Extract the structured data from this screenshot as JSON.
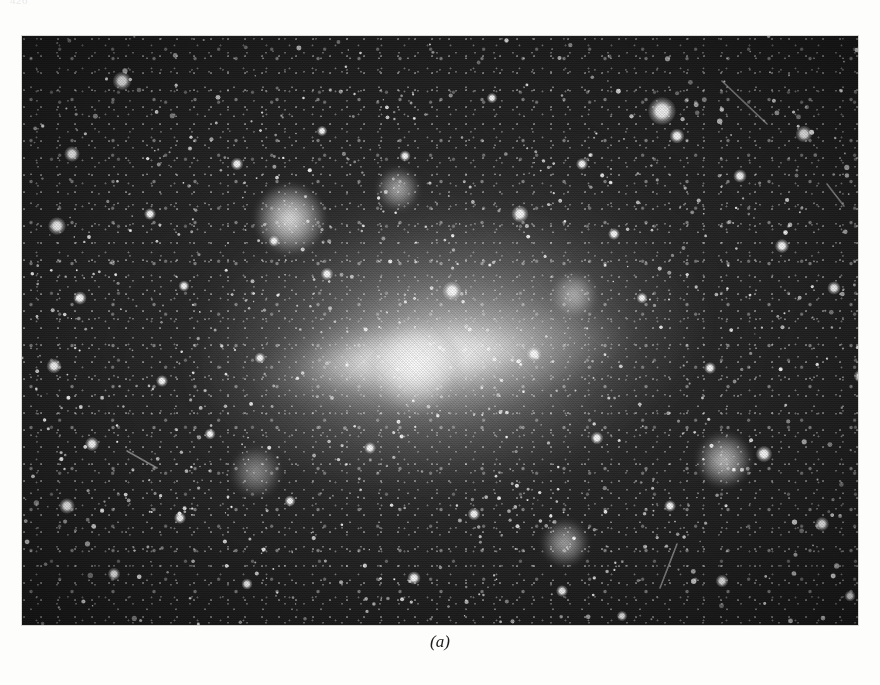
{
  "page": {
    "background_color": "#fdfdfc",
    "running_head": "426"
  },
  "figure": {
    "caption": "(a)",
    "plate_type": "halftone black-and-white astrophotograph",
    "frame": {
      "x": 22,
      "y": 36,
      "width": 836,
      "height": 589
    },
    "colors": {
      "sky_dark": "#1d1d1d",
      "sky_deep": "#141414",
      "star_white": "#ffffff",
      "halo_grey": "#a0a0a0",
      "plate_border": "#d8d8d6",
      "caption_ink": "#1c1c1c"
    },
    "knots": [
      {
        "name": "northwest-nebular-knot",
        "x": 32,
        "y": 31,
        "r": 34,
        "intensity": 0.95
      },
      {
        "name": "north-central-knot",
        "x": 45,
        "y": 26,
        "r": 20,
        "intensity": 0.7
      },
      {
        "name": "central-bar-core",
        "x": 47,
        "y": 56,
        "r": 46,
        "intensity": 1.0
      },
      {
        "name": "east-arm-knot",
        "x": 66,
        "y": 44,
        "r": 22,
        "intensity": 0.62
      },
      {
        "name": "southeast-cluster",
        "x": 84,
        "y": 72,
        "r": 26,
        "intensity": 0.78
      },
      {
        "name": "south-central-cluster",
        "x": 65,
        "y": 86,
        "r": 22,
        "intensity": 0.66
      },
      {
        "name": "southwest-wisp",
        "x": 28,
        "y": 74,
        "r": 24,
        "intensity": 0.52
      }
    ],
    "bright_stars": [
      {
        "x": 100,
        "y": 45,
        "r": 5.0
      },
      {
        "x": 640,
        "y": 75,
        "r": 7.5
      },
      {
        "x": 655,
        "y": 100,
        "r": 4.0
      },
      {
        "x": 782,
        "y": 98,
        "r": 4.5
      },
      {
        "x": 50,
        "y": 118,
        "r": 4.2
      },
      {
        "x": 215,
        "y": 128,
        "r": 3.4
      },
      {
        "x": 383,
        "y": 120,
        "r": 3.0
      },
      {
        "x": 560,
        "y": 128,
        "r": 3.2
      },
      {
        "x": 718,
        "y": 140,
        "r": 3.6
      },
      {
        "x": 848,
        "y": 152,
        "r": 3.4
      },
      {
        "x": 35,
        "y": 190,
        "r": 4.8
      },
      {
        "x": 128,
        "y": 178,
        "r": 3.2
      },
      {
        "x": 252,
        "y": 205,
        "r": 3.0
      },
      {
        "x": 498,
        "y": 178,
        "r": 4.6
      },
      {
        "x": 592,
        "y": 198,
        "r": 3.2
      },
      {
        "x": 760,
        "y": 210,
        "r": 3.8
      },
      {
        "x": 58,
        "y": 262,
        "r": 3.6
      },
      {
        "x": 162,
        "y": 250,
        "r": 3.0
      },
      {
        "x": 305,
        "y": 238,
        "r": 3.4
      },
      {
        "x": 430,
        "y": 255,
        "r": 5.2
      },
      {
        "x": 620,
        "y": 262,
        "r": 3.0
      },
      {
        "x": 812,
        "y": 252,
        "r": 3.6
      },
      {
        "x": 32,
        "y": 330,
        "r": 4.0
      },
      {
        "x": 140,
        "y": 345,
        "r": 3.2
      },
      {
        "x": 238,
        "y": 322,
        "r": 3.0
      },
      {
        "x": 512,
        "y": 318,
        "r": 4.0
      },
      {
        "x": 688,
        "y": 332,
        "r": 3.2
      },
      {
        "x": 838,
        "y": 340,
        "r": 3.4
      },
      {
        "x": 70,
        "y": 408,
        "r": 3.8
      },
      {
        "x": 188,
        "y": 398,
        "r": 3.0
      },
      {
        "x": 348,
        "y": 412,
        "r": 3.2
      },
      {
        "x": 575,
        "y": 402,
        "r": 3.4
      },
      {
        "x": 742,
        "y": 418,
        "r": 4.4
      },
      {
        "x": 45,
        "y": 470,
        "r": 4.2
      },
      {
        "x": 158,
        "y": 482,
        "r": 3.2
      },
      {
        "x": 268,
        "y": 465,
        "r": 3.0
      },
      {
        "x": 452,
        "y": 478,
        "r": 3.4
      },
      {
        "x": 648,
        "y": 470,
        "r": 3.2
      },
      {
        "x": 800,
        "y": 488,
        "r": 3.8
      },
      {
        "x": 92,
        "y": 538,
        "r": 3.4
      },
      {
        "x": 225,
        "y": 548,
        "r": 3.0
      },
      {
        "x": 392,
        "y": 542,
        "r": 3.6
      },
      {
        "x": 540,
        "y": 555,
        "r": 3.2
      },
      {
        "x": 700,
        "y": 545,
        "r": 3.4
      },
      {
        "x": 828,
        "y": 560,
        "r": 3.0
      },
      {
        "x": 300,
        "y": 95,
        "r": 2.8
      },
      {
        "x": 470,
        "y": 62,
        "r": 2.8
      },
      {
        "x": 600,
        "y": 580,
        "r": 2.8
      },
      {
        "x": 120,
        "y": 600,
        "r": 3.0
      }
    ],
    "streaks": [
      {
        "name": "trail-upper-right",
        "x1": 700,
        "y1": 45,
        "x2": 745,
        "y2": 88
      },
      {
        "name": "trail-left-mid",
        "x1": 105,
        "y1": 415,
        "x2": 135,
        "y2": 432
      },
      {
        "name": "trail-lower-right",
        "x1": 655,
        "y1": 508,
        "x2": 638,
        "y2": 552
      },
      {
        "name": "trail-right-upper",
        "x1": 805,
        "y1": 148,
        "x2": 822,
        "y2": 170
      }
    ]
  }
}
